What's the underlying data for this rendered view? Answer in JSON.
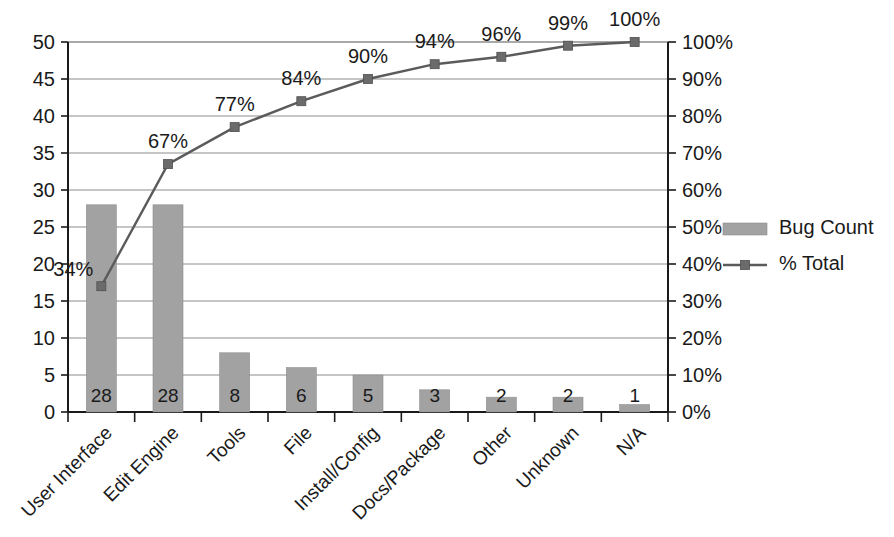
{
  "chart_data": {
    "type": "bar",
    "title": "",
    "subtitle": "",
    "xlabel": "",
    "ylabel": "",
    "y2label": "",
    "grid": true,
    "legend_position": "right",
    "categories": [
      "User Interface",
      "Edit Engine",
      "Tools",
      "File",
      "Install/Config",
      "Docs/Package",
      "Other",
      "Unknown",
      "N/A"
    ],
    "series": [
      {
        "name": "Bug Count",
        "type": "bar",
        "axis": "left",
        "values": [
          28,
          28,
          8,
          6,
          5,
          3,
          2,
          2,
          1
        ],
        "data_labels": [
          "28",
          "28",
          "8",
          "6",
          "5",
          "3",
          "2",
          "2",
          "1"
        ],
        "color": "#a2a2a2"
      },
      {
        "name": "% Total",
        "type": "line",
        "axis": "right",
        "values": [
          34,
          67,
          77,
          84,
          90,
          94,
          96,
          99,
          100
        ],
        "data_labels": [
          "34%",
          "67%",
          "77%",
          "84%",
          "90%",
          "94%",
          "96%",
          "99%",
          "100%"
        ],
        "color": "#5b5b5b",
        "marker": "square"
      }
    ],
    "ylim": [
      0,
      50
    ],
    "yticks": [
      0,
      5,
      10,
      15,
      20,
      25,
      30,
      35,
      40,
      45,
      50
    ],
    "ytick_labels": [
      "0",
      "5",
      "10",
      "15",
      "20",
      "25",
      "30",
      "35",
      "40",
      "45",
      "50"
    ],
    "y2lim": [
      0,
      100
    ],
    "y2ticks": [
      0,
      10,
      20,
      30,
      40,
      50,
      60,
      70,
      80,
      90,
      100
    ],
    "y2tick_labels": [
      "0%",
      "10%",
      "20%",
      "30%",
      "40%",
      "50%",
      "60%",
      "70%",
      "80%",
      "90%",
      "100%"
    ]
  },
  "legend": {
    "items": [
      {
        "label": "Bug Count",
        "swatch": "bar-swatch",
        "color": "#a2a2a2"
      },
      {
        "label": "% Total",
        "swatch": "line-marker-swatch",
        "color": "#5b5b5b"
      }
    ]
  },
  "colors": {
    "bar_fill": "#a2a2a2",
    "line": "#5b5b5b",
    "marker": "#6b6b6b",
    "gridline": "#8c8c8c",
    "axis": "#1a1a1a",
    "text": "#1a1a1a",
    "background": "#ffffff"
  }
}
